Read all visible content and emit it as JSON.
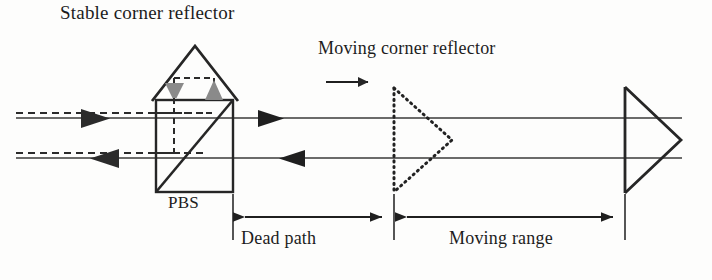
{
  "figure": {
    "type": "optical-interferometer-schematic",
    "title_caption": "Heterodyne interferometer with polarizing beam splitter, stable and moving corner reflectors",
    "width": 712,
    "height": 280,
    "background_color": "#fdfdfc",
    "line_color": "#262626",
    "gray_arrow_color": "#8a8a8a",
    "dashed_beam_color": "#2a2a2a"
  },
  "labels": {
    "stable_reflector": "Stable corner reflector",
    "moving_reflector": "Moving corner reflector",
    "pbs": "PBS",
    "dead_path": "Dead path",
    "moving_range": "Moving range"
  },
  "components": [
    {
      "name": "stable-corner-reflector",
      "shape": "triangle-apex-up",
      "label": "Stable corner reflector",
      "style": "solid",
      "apex": [
        195,
        47
      ],
      "base_left": [
        156,
        100
      ],
      "base_right": [
        233,
        100
      ]
    },
    {
      "name": "polarizing-beam-splitter",
      "shape": "square-with-diagonal",
      "label": "PBS",
      "style": "solid",
      "left": 156,
      "top": 100,
      "right": 233,
      "bottom": 192,
      "diagonal": "bottom-left-to-top-right"
    },
    {
      "name": "moving-corner-reflector-start",
      "shape": "triangle-apex-right",
      "label": "Moving corner reflector",
      "style": "dotted",
      "apex": [
        452,
        140
      ],
      "top_left": [
        394,
        89
      ],
      "bottom_left": [
        394,
        192
      ]
    },
    {
      "name": "moving-corner-reflector-end",
      "shape": "triangle-apex-right",
      "label": "",
      "style": "solid",
      "apex": [
        680,
        140
      ],
      "top_left": [
        625,
        88
      ],
      "bottom_left": [
        625,
        192
      ]
    }
  ],
  "beams": [
    {
      "name": "input-beam-solid-top",
      "style": "solid",
      "y": 118,
      "from_x": 16,
      "to_x": 233,
      "direction": "right"
    },
    {
      "name": "input-beam-dashed-top",
      "style": "dashed",
      "y": 113,
      "from_x": 16,
      "to_x": 200,
      "direction": "right"
    },
    {
      "name": "output-beam-solid-bottom",
      "style": "solid",
      "y": 158,
      "from_x": 16,
      "to_x": 233,
      "direction": "left"
    },
    {
      "name": "output-beam-dashed-bottom",
      "style": "dashed",
      "y": 153,
      "from_x": 16,
      "to_x": 200,
      "direction": "left"
    },
    {
      "name": "measurement-beam-top",
      "style": "solid",
      "y": 118,
      "from_x": 233,
      "to_x": 680,
      "direction": "right"
    },
    {
      "name": "measurement-beam-bottom",
      "style": "solid",
      "y": 158,
      "from_x": 233,
      "to_x": 680,
      "direction": "left"
    }
  ],
  "arrows": [
    {
      "name": "input-arrow-right",
      "x": 95,
      "y": 118,
      "direction": "right",
      "color": "dark"
    },
    {
      "name": "output-arrow-left",
      "x": 105,
      "y": 158,
      "direction": "left",
      "color": "dark"
    },
    {
      "name": "beam-arrow-right-mid",
      "x": 272,
      "y": 118,
      "direction": "right",
      "color": "dark"
    },
    {
      "name": "beam-arrow-left-mid",
      "x": 292,
      "y": 158,
      "direction": "left",
      "color": "dark"
    },
    {
      "name": "reflector-arrow-down",
      "x": 174,
      "y": 95,
      "direction": "down",
      "color": "gray"
    },
    {
      "name": "reflector-arrow-up",
      "x": 214,
      "y": 95,
      "direction": "up",
      "color": "gray"
    },
    {
      "name": "motion-direction-arrow",
      "x": 345,
      "y": 82,
      "direction": "right",
      "color": "dark"
    }
  ],
  "dimensions": [
    {
      "name": "dead-path-dimension",
      "label": "Dead path",
      "from_x": 233,
      "to_x": 394,
      "y": 217,
      "arrowheads": "both"
    },
    {
      "name": "moving-range-dimension",
      "label": "Moving range",
      "from_x": 394,
      "to_x": 625,
      "y": 217,
      "arrowheads": "both"
    }
  ]
}
